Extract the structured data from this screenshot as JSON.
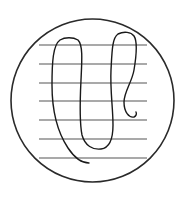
{
  "figure": {
    "width": 183,
    "height": 198,
    "background": "#ffffff",
    "circle": {
      "cx": 92.5,
      "cy": 100.5,
      "r": 81.5,
      "stroke": "#2a2a2a",
      "stroke_width": 1.6
    },
    "lines": {
      "x1": 39,
      "x2": 147,
      "ys": [
        45,
        64,
        83,
        101,
        120,
        139,
        158
      ],
      "stroke": "#555555",
      "stroke_width": 1.2
    },
    "curve": {
      "stroke": "#1a1a1a",
      "stroke_width": 1.4,
      "path": "M 89 163 C 80 163, 74 157, 68 148 C 58 133, 52 112, 52 85 C 52 62, 53 45, 60 40 C 65 37, 73 37, 78 40 C 83 45, 82 60, 81 80 C 80 100, 79 120, 82 135 C 85 146, 93 150, 101 149 C 109 148, 113 140, 113 125 C 113 108, 110 90, 111 70 C 112 52, 112 38, 118 34 C 124 31, 131 32, 134 36 C 138 42, 136 58, 134 70 C 132 82, 124 92, 124 102 C 124 112, 129 118, 134 117 C 136 116, 137 114, 136 112"
    }
  }
}
